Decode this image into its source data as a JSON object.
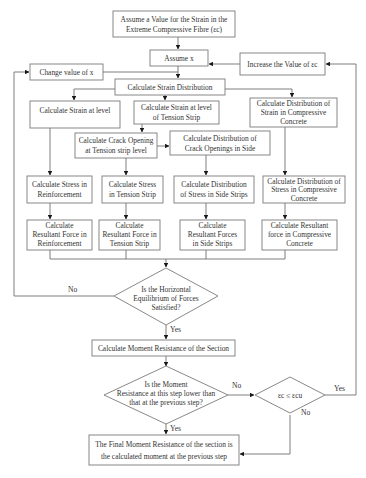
{
  "flowchart": {
    "start": {
      "lines": [
        "Assume a Value for the Strain in the",
        "Extreme Compressive Fibre (εc)"
      ]
    },
    "assume_x": {
      "lines": [
        "Assume x"
      ]
    },
    "change_x": {
      "lines": [
        "Change value of x"
      ]
    },
    "increase_ec": {
      "lines": [
        "Increase the Value of εc"
      ]
    },
    "strain_distribution": {
      "lines": [
        "Calculate Strain Distribution"
      ]
    },
    "strain_level": {
      "lines": [
        "Calculate Strain at level"
      ]
    },
    "strain_tension": {
      "lines": [
        "Calculate Strain at level",
        "of Tension Strip"
      ]
    },
    "strain_compressive": {
      "lines": [
        "Calculate Distribution of",
        "Strain in Compressive",
        "Concrete"
      ]
    },
    "crack_opening": {
      "lines": [
        "Calculate Crack Opening",
        "at Tension strip level"
      ]
    },
    "crack_distribution": {
      "lines": [
        "Calculate Distribution of",
        "Crack Openings in Side"
      ]
    },
    "stress_reinf": {
      "lines": [
        "Calculate Stress in",
        "Reinforcement"
      ]
    },
    "stress_tension": {
      "lines": [
        "Calculate Stress",
        "in Tension Strip"
      ]
    },
    "stress_side": {
      "lines": [
        "Calculate Distribution",
        "of Stress in Side Strips"
      ]
    },
    "stress_compressive": {
      "lines": [
        "Calculate Distribution of",
        "Stress in Compressive",
        "Concrete"
      ]
    },
    "force_reinf": {
      "lines": [
        "Calculate",
        "Resultant Force in",
        "Reinforcement"
      ]
    },
    "force_tension": {
      "lines": [
        "Calculate",
        "Resultant Force in",
        "Tension Strip"
      ]
    },
    "force_side": {
      "lines": [
        "Calculate",
        "Resultant Forces",
        "in Side Strips"
      ]
    },
    "force_compressive": {
      "lines": [
        "Calculate Resultant",
        "force in Compressive",
        "Concrete"
      ]
    },
    "decision_equilibrium": {
      "lines": [
        "Is the Horizontal",
        "Equilibrium of Forces",
        "Satisfied?"
      ]
    },
    "moment": {
      "lines": [
        "Calculate Moment Resistance of the Section"
      ]
    },
    "decision_moment": {
      "lines": [
        "Is the Moment",
        "Resistance at this step lower than",
        "that at the previous step?"
      ]
    },
    "decision_strain": {
      "lines": [
        "εc ≤ εcu"
      ]
    },
    "final": {
      "lines": [
        "The Final Moment Resistance of the section is",
        "the calculated moment at the previous step"
      ]
    },
    "labels": {
      "eq_no": "No",
      "eq_yes": "Yes",
      "moment_no": "No",
      "moment_yes": "Yes",
      "strain_yes": "Yes",
      "strain_no": "No"
    }
  }
}
